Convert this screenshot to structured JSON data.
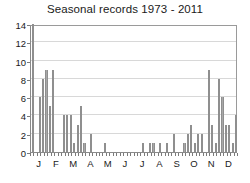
{
  "chart_data": {
    "type": "bar",
    "title": "Seasonal records 1973 - 2011",
    "xlabel": "",
    "ylabel": "",
    "ylim": [
      0,
      14
    ],
    "y_ticks": [
      0,
      2,
      4,
      6,
      8,
      10,
      12,
      14
    ],
    "x_tick_labels": [
      "J",
      "F",
      "M",
      "A",
      "M",
      "J",
      "J",
      "A",
      "S",
      "O",
      "N",
      "D"
    ],
    "grid": true,
    "legend": "none",
    "bar_color": "#a8a8a8",
    "categories": [
      "J1",
      "J2",
      "J3",
      "J4",
      "J5",
      "F1",
      "F2",
      "F3",
      "F4",
      "F5",
      "M1",
      "M2",
      "M3",
      "M4",
      "M5",
      "A1",
      "A2",
      "A3",
      "A4",
      "A5",
      "M1b",
      "M2b",
      "M3b",
      "M4b",
      "M5b",
      "J1b",
      "J2b",
      "J3b",
      "J4b",
      "J5b",
      "J1c",
      "J2c",
      "J3c",
      "J4c",
      "J5c",
      "A1b",
      "A2b",
      "A3b",
      "A4b",
      "A5b",
      "S1",
      "S2",
      "S3",
      "S4",
      "S5",
      "O1",
      "O2",
      "O3",
      "O4",
      "O5",
      "N1",
      "N2",
      "N3",
      "N4",
      "N5",
      "D1",
      "D2",
      "D3",
      "D4",
      "D5"
    ],
    "values": [
      14,
      0,
      6,
      8,
      9,
      5,
      9,
      0,
      0,
      4,
      4,
      4,
      1,
      3,
      5,
      1,
      0,
      2,
      0,
      0,
      0,
      1,
      0,
      0,
      0,
      0,
      0,
      0,
      0,
      0,
      0,
      0,
      1,
      0,
      1,
      1,
      0,
      1,
      0,
      1,
      0,
      2,
      0,
      0,
      1,
      2,
      3,
      1,
      2,
      2,
      0,
      9,
      3,
      1,
      8,
      6,
      3,
      3,
      1,
      4
    ]
  }
}
